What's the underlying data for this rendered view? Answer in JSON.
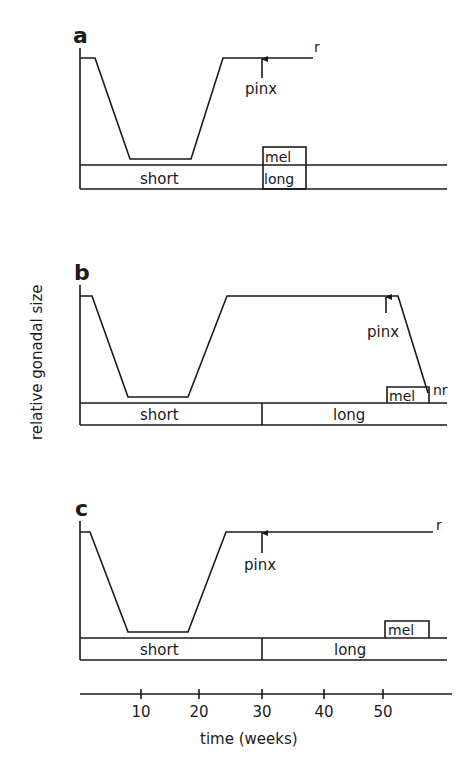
{
  "figure": {
    "y_axis_label": "relative gonadal size",
    "x_axis": {
      "label": "time (weeks)",
      "ticks": [
        {
          "value": "10",
          "x": 141
        },
        {
          "value": "20",
          "x": 199
        },
        {
          "value": "30",
          "x": 262
        },
        {
          "value": "40",
          "x": 324
        },
        {
          "value": "50",
          "x": 383
        }
      ]
    },
    "panels": [
      {
        "id": "a",
        "label": "a",
        "curve_points": "80,58 95,58 130,159 191,159 223,58 313,58",
        "end_label": "r",
        "end_label_pos": [
          314,
          52
        ],
        "arrow_x": 262,
        "arrow_y1": 78,
        "arrow_y2": 59,
        "pinx_label": "pinx",
        "pinx_pos": [
          245,
          94
        ],
        "photoperiod": {
          "short": "short",
          "long": "long",
          "long_start_week": 30,
          "long_end_week": 37
        },
        "mel_label": "mel",
        "mel_box": {
          "x1": 263,
          "x2": 306,
          "top": 147
        },
        "bar_top": 165,
        "bar_bottom": 189,
        "axis_top": 48,
        "label_pos": [
          73,
          43
        ],
        "short_pos": [
          140,
          184
        ],
        "long_pos": [
          264,
          184
        ],
        "mel_pos": [
          265,
          162
        ]
      },
      {
        "id": "b",
        "label": "b",
        "curve_points": "80,296 92,296 128,397 188,397 227,296 398,296 428,393",
        "end_label": "nr",
        "end_label_pos": [
          433,
          395
        ],
        "arrow_x": 386,
        "arrow_y1": 313,
        "arrow_y2": 297,
        "pinx_label": "pinx",
        "pinx_pos": [
          367,
          337
        ],
        "photoperiod": {
          "short": "short",
          "long": "long",
          "divider_week": 30
        },
        "mel_label": "mel",
        "mel_box": {
          "x1": 387,
          "x2": 429,
          "top": 387
        },
        "bar_top": 403,
        "bar_bottom": 425,
        "axis_top": 285,
        "label_pos": [
          74,
          280
        ],
        "short_pos": [
          140,
          420
        ],
        "long_pos": [
          333,
          420
        ],
        "mel_pos": [
          389,
          401
        ]
      },
      {
        "id": "c",
        "label": "c",
        "curve_points": "80,532 90,532 128,632 188,632 226,532 433,532",
        "end_label": "r",
        "end_label_pos": [
          436,
          530
        ],
        "arrow_x": 262,
        "arrow_y1": 553,
        "arrow_y2": 533,
        "pinx_label": "pinx",
        "pinx_pos": [
          244,
          570
        ],
        "photoperiod": {
          "short": "short",
          "long": "long",
          "divider_week": 30
        },
        "mel_label": "mel",
        "mel_box": {
          "x1": 385,
          "x2": 429,
          "top": 621
        },
        "bar_top": 638,
        "bar_bottom": 660,
        "axis_top": 521,
        "label_pos": [
          75,
          516
        ],
        "short_pos": [
          140,
          655
        ],
        "long_pos": [
          334,
          655
        ],
        "mel_pos": [
          388,
          635
        ]
      }
    ],
    "x_axis_line": {
      "y": 694,
      "x1": 80,
      "x2": 452
    },
    "bar_x1": 80,
    "bar_x2": 447,
    "divider_x": 262
  }
}
